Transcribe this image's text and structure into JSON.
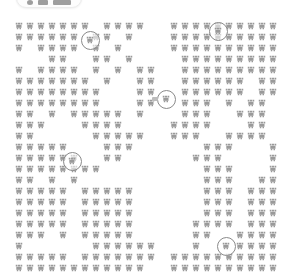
{
  "view": {
    "name": "map-marker-grid",
    "width": 296,
    "height": 275,
    "background_color": "#ffffff",
    "marker_color": "#9a9a9a",
    "highlight_ring_color": "#8a8a8a"
  },
  "toolbar": {
    "visible_partially": true,
    "items": [
      {
        "name": "toolbar-dot",
        "kind": "dot"
      },
      {
        "name": "toolbar-button",
        "kind": "item"
      },
      {
        "name": "toolbar-slider",
        "kind": "wide"
      }
    ]
  },
  "markers": {
    "icon_name": "tree-marker-icon",
    "count": 422,
    "grid_pitch_x": 11,
    "grid_pitch_y": 11,
    "points": [
      [
        19,
        26
      ],
      [
        30,
        26
      ],
      [
        41,
        26
      ],
      [
        52,
        26
      ],
      [
        63,
        26
      ],
      [
        74,
        26
      ],
      [
        85,
        26
      ],
      [
        107,
        26
      ],
      [
        118,
        26
      ],
      [
        129,
        26
      ],
      [
        140,
        26
      ],
      [
        174,
        26
      ],
      [
        185,
        26
      ],
      [
        196,
        26
      ],
      [
        207,
        26
      ],
      [
        218,
        26
      ],
      [
        229,
        26
      ],
      [
        240,
        26
      ],
      [
        251,
        26
      ],
      [
        262,
        26
      ],
      [
        273,
        26
      ],
      [
        19,
        37
      ],
      [
        30,
        37
      ],
      [
        41,
        37
      ],
      [
        52,
        37
      ],
      [
        63,
        37
      ],
      [
        74,
        37
      ],
      [
        96,
        37
      ],
      [
        107,
        37
      ],
      [
        129,
        37
      ],
      [
        174,
        37
      ],
      [
        185,
        37
      ],
      [
        196,
        37
      ],
      [
        207,
        37
      ],
      [
        218,
        37
      ],
      [
        229,
        37
      ],
      [
        240,
        37
      ],
      [
        251,
        37
      ],
      [
        262,
        37
      ],
      [
        273,
        37
      ],
      [
        19,
        48
      ],
      [
        41,
        48
      ],
      [
        52,
        48
      ],
      [
        63,
        48
      ],
      [
        74,
        48
      ],
      [
        96,
        48
      ],
      [
        118,
        48
      ],
      [
        174,
        48
      ],
      [
        185,
        48
      ],
      [
        196,
        48
      ],
      [
        207,
        48
      ],
      [
        218,
        48
      ],
      [
        229,
        48
      ],
      [
        240,
        48
      ],
      [
        251,
        48
      ],
      [
        262,
        48
      ],
      [
        273,
        48
      ],
      [
        52,
        59
      ],
      [
        63,
        59
      ],
      [
        96,
        59
      ],
      [
        107,
        59
      ],
      [
        129,
        59
      ],
      [
        185,
        59
      ],
      [
        196,
        59
      ],
      [
        207,
        59
      ],
      [
        218,
        59
      ],
      [
        229,
        59
      ],
      [
        240,
        59
      ],
      [
        251,
        59
      ],
      [
        262,
        59
      ],
      [
        273,
        59
      ],
      [
        19,
        70
      ],
      [
        41,
        70
      ],
      [
        52,
        70
      ],
      [
        63,
        70
      ],
      [
        74,
        70
      ],
      [
        96,
        70
      ],
      [
        118,
        70
      ],
      [
        140,
        70
      ],
      [
        151,
        70
      ],
      [
        185,
        70
      ],
      [
        196,
        70
      ],
      [
        207,
        70
      ],
      [
        218,
        70
      ],
      [
        229,
        70
      ],
      [
        240,
        70
      ],
      [
        251,
        70
      ],
      [
        262,
        70
      ],
      [
        273,
        70
      ],
      [
        19,
        81
      ],
      [
        30,
        81
      ],
      [
        41,
        81
      ],
      [
        52,
        81
      ],
      [
        63,
        81
      ],
      [
        74,
        81
      ],
      [
        85,
        81
      ],
      [
        107,
        81
      ],
      [
        140,
        81
      ],
      [
        151,
        81
      ],
      [
        185,
        81
      ],
      [
        196,
        81
      ],
      [
        207,
        81
      ],
      [
        218,
        81
      ],
      [
        229,
        81
      ],
      [
        240,
        81
      ],
      [
        262,
        81
      ],
      [
        273,
        81
      ],
      [
        19,
        92
      ],
      [
        30,
        92
      ],
      [
        41,
        92
      ],
      [
        52,
        92
      ],
      [
        63,
        92
      ],
      [
        74,
        92
      ],
      [
        85,
        92
      ],
      [
        96,
        92
      ],
      [
        140,
        92
      ],
      [
        151,
        92
      ],
      [
        185,
        92
      ],
      [
        196,
        92
      ],
      [
        207,
        92
      ],
      [
        218,
        92
      ],
      [
        229,
        92
      ],
      [
        240,
        92
      ],
      [
        262,
        92
      ],
      [
        273,
        92
      ],
      [
        19,
        103
      ],
      [
        30,
        103
      ],
      [
        41,
        103
      ],
      [
        52,
        103
      ],
      [
        63,
        103
      ],
      [
        74,
        103
      ],
      [
        85,
        103
      ],
      [
        96,
        103
      ],
      [
        140,
        103
      ],
      [
        151,
        103
      ],
      [
        185,
        103
      ],
      [
        196,
        103
      ],
      [
        207,
        103
      ],
      [
        229,
        103
      ],
      [
        251,
        103
      ],
      [
        262,
        103
      ],
      [
        19,
        114
      ],
      [
        30,
        114
      ],
      [
        52,
        114
      ],
      [
        74,
        114
      ],
      [
        85,
        114
      ],
      [
        96,
        114
      ],
      [
        107,
        114
      ],
      [
        118,
        114
      ],
      [
        140,
        114
      ],
      [
        185,
        114
      ],
      [
        196,
        114
      ],
      [
        207,
        114
      ],
      [
        240,
        114
      ],
      [
        251,
        114
      ],
      [
        262,
        114
      ],
      [
        19,
        125
      ],
      [
        30,
        125
      ],
      [
        41,
        125
      ],
      [
        85,
        125
      ],
      [
        96,
        125
      ],
      [
        107,
        125
      ],
      [
        118,
        125
      ],
      [
        174,
        125
      ],
      [
        185,
        125
      ],
      [
        196,
        125
      ],
      [
        207,
        125
      ],
      [
        251,
        125
      ],
      [
        262,
        125
      ],
      [
        19,
        136
      ],
      [
        30,
        136
      ],
      [
        96,
        136
      ],
      [
        107,
        136
      ],
      [
        118,
        136
      ],
      [
        129,
        136
      ],
      [
        140,
        136
      ],
      [
        174,
        136
      ],
      [
        185,
        136
      ],
      [
        196,
        136
      ],
      [
        229,
        136
      ],
      [
        240,
        136
      ],
      [
        251,
        136
      ],
      [
        262,
        136
      ],
      [
        19,
        147
      ],
      [
        30,
        147
      ],
      [
        41,
        147
      ],
      [
        52,
        147
      ],
      [
        63,
        147
      ],
      [
        107,
        147
      ],
      [
        118,
        147
      ],
      [
        129,
        147
      ],
      [
        207,
        147
      ],
      [
        218,
        147
      ],
      [
        229,
        147
      ],
      [
        273,
        147
      ],
      [
        19,
        158
      ],
      [
        30,
        158
      ],
      [
        41,
        158
      ],
      [
        52,
        158
      ],
      [
        63,
        158
      ],
      [
        74,
        158
      ],
      [
        107,
        158
      ],
      [
        118,
        158
      ],
      [
        196,
        158
      ],
      [
        207,
        158
      ],
      [
        218,
        158
      ],
      [
        273,
        158
      ],
      [
        19,
        169
      ],
      [
        30,
        169
      ],
      [
        41,
        169
      ],
      [
        52,
        169
      ],
      [
        63,
        169
      ],
      [
        74,
        169
      ],
      [
        85,
        169
      ],
      [
        96,
        169
      ],
      [
        207,
        169
      ],
      [
        218,
        169
      ],
      [
        229,
        169
      ],
      [
        273,
        169
      ],
      [
        19,
        180
      ],
      [
        30,
        180
      ],
      [
        52,
        180
      ],
      [
        74,
        180
      ],
      [
        207,
        180
      ],
      [
        218,
        180
      ],
      [
        229,
        180
      ],
      [
        262,
        180
      ],
      [
        273,
        180
      ],
      [
        19,
        191
      ],
      [
        30,
        191
      ],
      [
        41,
        191
      ],
      [
        52,
        191
      ],
      [
        63,
        191
      ],
      [
        85,
        191
      ],
      [
        96,
        191
      ],
      [
        107,
        191
      ],
      [
        118,
        191
      ],
      [
        129,
        191
      ],
      [
        207,
        191
      ],
      [
        218,
        191
      ],
      [
        229,
        191
      ],
      [
        251,
        191
      ],
      [
        262,
        191
      ],
      [
        273,
        191
      ],
      [
        19,
        202
      ],
      [
        30,
        202
      ],
      [
        41,
        202
      ],
      [
        52,
        202
      ],
      [
        63,
        202
      ],
      [
        85,
        202
      ],
      [
        96,
        202
      ],
      [
        107,
        202
      ],
      [
        118,
        202
      ],
      [
        129,
        202
      ],
      [
        207,
        202
      ],
      [
        218,
        202
      ],
      [
        229,
        202
      ],
      [
        251,
        202
      ],
      [
        262,
        202
      ],
      [
        273,
        202
      ],
      [
        19,
        213
      ],
      [
        30,
        213
      ],
      [
        41,
        213
      ],
      [
        52,
        213
      ],
      [
        63,
        213
      ],
      [
        85,
        213
      ],
      [
        96,
        213
      ],
      [
        107,
        213
      ],
      [
        118,
        213
      ],
      [
        129,
        213
      ],
      [
        207,
        213
      ],
      [
        218,
        213
      ],
      [
        229,
        213
      ],
      [
        251,
        213
      ],
      [
        262,
        213
      ],
      [
        273,
        213
      ],
      [
        19,
        224
      ],
      [
        30,
        224
      ],
      [
        41,
        224
      ],
      [
        52,
        224
      ],
      [
        63,
        224
      ],
      [
        85,
        224
      ],
      [
        96,
        224
      ],
      [
        107,
        224
      ],
      [
        118,
        224
      ],
      [
        129,
        224
      ],
      [
        196,
        224
      ],
      [
        207,
        224
      ],
      [
        218,
        224
      ],
      [
        229,
        224
      ],
      [
        251,
        224
      ],
      [
        262,
        224
      ],
      [
        273,
        224
      ],
      [
        19,
        235
      ],
      [
        30,
        235
      ],
      [
        41,
        235
      ],
      [
        63,
        235
      ],
      [
        85,
        235
      ],
      [
        96,
        235
      ],
      [
        107,
        235
      ],
      [
        118,
        235
      ],
      [
        129,
        235
      ],
      [
        196,
        235
      ],
      [
        207,
        235
      ],
      [
        240,
        235
      ],
      [
        251,
        235
      ],
      [
        262,
        235
      ],
      [
        273,
        235
      ],
      [
        19,
        246
      ],
      [
        96,
        246
      ],
      [
        107,
        246
      ],
      [
        118,
        246
      ],
      [
        129,
        246
      ],
      [
        140,
        246
      ],
      [
        151,
        246
      ],
      [
        196,
        246
      ],
      [
        240,
        246
      ],
      [
        251,
        246
      ],
      [
        262,
        246
      ],
      [
        273,
        246
      ],
      [
        19,
        257
      ],
      [
        30,
        257
      ],
      [
        41,
        257
      ],
      [
        52,
        257
      ],
      [
        63,
        257
      ],
      [
        85,
        257
      ],
      [
        96,
        257
      ],
      [
        107,
        257
      ],
      [
        118,
        257
      ],
      [
        129,
        257
      ],
      [
        140,
        257
      ],
      [
        151,
        257
      ],
      [
        174,
        257
      ],
      [
        185,
        257
      ],
      [
        196,
        257
      ],
      [
        207,
        257
      ],
      [
        218,
        257
      ],
      [
        229,
        257
      ],
      [
        240,
        257
      ],
      [
        251,
        257
      ],
      [
        262,
        257
      ],
      [
        273,
        257
      ],
      [
        19,
        268
      ],
      [
        30,
        268
      ],
      [
        41,
        268
      ],
      [
        52,
        268
      ],
      [
        63,
        268
      ],
      [
        74,
        268
      ],
      [
        85,
        268
      ],
      [
        96,
        268
      ],
      [
        107,
        268
      ],
      [
        118,
        268
      ],
      [
        129,
        268
      ],
      [
        140,
        268
      ],
      [
        174,
        268
      ],
      [
        185,
        268
      ],
      [
        196,
        268
      ],
      [
        207,
        268
      ],
      [
        218,
        268
      ],
      [
        229,
        268
      ],
      [
        240,
        268
      ],
      [
        251,
        268
      ],
      [
        262,
        268
      ],
      [
        273,
        268
      ]
    ]
  },
  "highlights": [
    {
      "name": "highlight-marker-1",
      "x": 90,
      "y": 40,
      "has_tail": false
    },
    {
      "name": "highlight-marker-2",
      "x": 218,
      "y": 31,
      "has_tail": false
    },
    {
      "name": "highlight-marker-3",
      "x": 166,
      "y": 99,
      "has_tail": true
    },
    {
      "name": "highlight-marker-4",
      "x": 72,
      "y": 161,
      "has_tail": false
    },
    {
      "name": "highlight-marker-5",
      "x": 226,
      "y": 246,
      "has_tail": false
    }
  ]
}
